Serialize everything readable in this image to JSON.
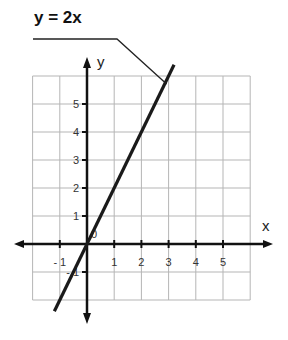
{
  "chart_data": {
    "type": "line",
    "title": "y = 2x",
    "xlabel": "x",
    "ylabel": "y",
    "equation": "y = 2x",
    "x_ticks": [
      -1,
      1,
      2,
      3,
      4,
      5
    ],
    "y_ticks": [
      -1,
      1,
      2,
      3,
      4,
      5
    ],
    "origin_label": "0",
    "xlim": [
      -2,
      6
    ],
    "ylim": [
      -2,
      6
    ],
    "grid": true,
    "series": [
      {
        "name": "y = 2x",
        "x": [
          -1.2,
          0,
          1,
          2,
          3,
          3.2
        ],
        "y": [
          -2.4,
          0,
          2,
          4,
          6,
          6.4
        ]
      }
    ],
    "annotations": [
      {
        "text": "y = 2x",
        "points_to": [
          3,
          6
        ]
      }
    ]
  },
  "colors": {
    "grid": "#b5b5b5",
    "axis": "#111111",
    "line": "#1a1a1a"
  }
}
